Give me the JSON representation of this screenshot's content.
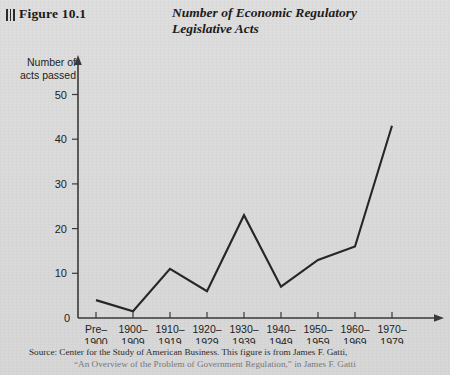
{
  "figure": {
    "label": "Figure 10.1",
    "rule_marks": 3
  },
  "title": {
    "line1": "Number of Economic Regulatory",
    "line2": "Legislative Acts"
  },
  "axis": {
    "ylabel_line1": "Number of",
    "ylabel_line2": "acts passed"
  },
  "source": {
    "line1": "Source: Center for the Study of American Business. This figure is from James F. Gatti,",
    "line2": "“An Overview of the Problem of Government Regulation,” in James F. Gatti"
  },
  "colors": {
    "background": "#dcdcdc",
    "ink": "#1b1b1b",
    "line": "#262626",
    "axis": "#3a3a3a"
  },
  "chart_data": {
    "type": "line",
    "title": "Number of Economic Regulatory Legislative Acts",
    "xlabel": "",
    "ylabel": "Number of acts passed",
    "categories": [
      "Pre–\n1900",
      "1900–\n1909",
      "1910–\n1919",
      "1920–\n1929",
      "1930–\n1939",
      "1940–\n1949",
      "1950–\n1959",
      "1960–\n1969",
      "1970–\n1979"
    ],
    "categories_top": [
      "Pre–",
      "1900–",
      "1910–",
      "1920–",
      "1930–",
      "1940–",
      "1950–",
      "1960–",
      "1970–"
    ],
    "categories_bottom": [
      "1900",
      "1909",
      "1919",
      "1929",
      "1939",
      "1949",
      "1959",
      "1969",
      "1979"
    ],
    "values": [
      4,
      1.5,
      11,
      6,
      23,
      7,
      13,
      16,
      43
    ],
    "yticks": [
      0,
      10,
      20,
      30,
      40,
      50
    ],
    "ylim": [
      0,
      56
    ],
    "grid": false,
    "legend": false,
    "markers": false,
    "axis_arrows": true
  }
}
